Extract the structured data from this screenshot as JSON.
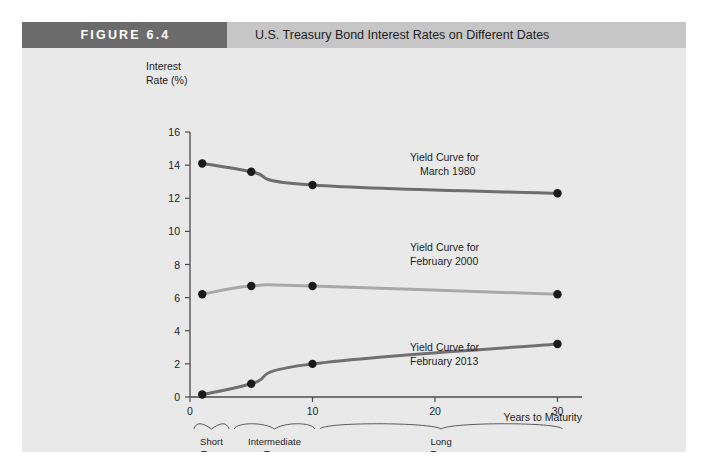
{
  "figure": {
    "badge_label": "FIGURE  6.4",
    "title": "U.S. Treasury Bond Interest Rates on Different Dates",
    "badge_color": "#6b6b6b",
    "title_bar_color": "#c6c6c6",
    "panel_color": "#e9e9e9"
  },
  "chart_data": {
    "type": "line",
    "title": "U.S. Treasury Bond Interest Rates on Different Dates",
    "xlabel": "Years to Maturity",
    "ylabel": "Interest Rate (%)",
    "ylabel_line1": "Interest",
    "ylabel_line2": "Rate (%)",
    "xlim": [
      0,
      32
    ],
    "ylim": [
      0,
      16
    ],
    "xticks": [
      0,
      10,
      20,
      30
    ],
    "xtick_labels": [
      "0",
      "10",
      "20",
      "30"
    ],
    "yticks": [
      0,
      2,
      4,
      6,
      8,
      10,
      12,
      14,
      16
    ],
    "ytick_labels": [
      "0",
      "2",
      "4",
      "6",
      "8",
      "10",
      "12",
      "14",
      "16"
    ],
    "grid": false,
    "legend_position": "inline-annotations",
    "series": [
      {
        "name": "Yield Curve for March 1980",
        "label_line1": "Yield Curve for",
        "label_line2": "March 1980",
        "color": "#6e6e6e",
        "marker_color": "#1a1a1a",
        "x": [
          1,
          5,
          10,
          30
        ],
        "values": [
          14.1,
          13.6,
          12.8,
          12.3
        ]
      },
      {
        "name": "Yield Curve for February 2000",
        "label_line1": "Yield Curve for",
        "label_line2": "February 2000",
        "color": "#a8a8a8",
        "marker_color": "#1a1a1a",
        "x": [
          1,
          5,
          10,
          30
        ],
        "values": [
          6.2,
          6.7,
          6.7,
          6.2
        ]
      },
      {
        "name": "Yield Curve for February 2013",
        "label_line1": "Yield Curve for",
        "label_line2": "February 2013",
        "color": "#707070",
        "marker_color": "#1a1a1a",
        "x": [
          1,
          5,
          10,
          30
        ],
        "values": [
          0.15,
          0.8,
          2.0,
          3.2
        ]
      }
    ],
    "maturity_brackets": [
      {
        "label_line1": "Short",
        "label_line2": "Term",
        "x_start": 0.3,
        "x_end": 3.2
      },
      {
        "label_line1": "Intermediate",
        "label_line2": "Term",
        "x_start": 3.6,
        "x_end": 10.2
      },
      {
        "label_line1": "Long",
        "label_line2": "Term",
        "x_start": 10.6,
        "x_end": 30.4
      }
    ]
  }
}
